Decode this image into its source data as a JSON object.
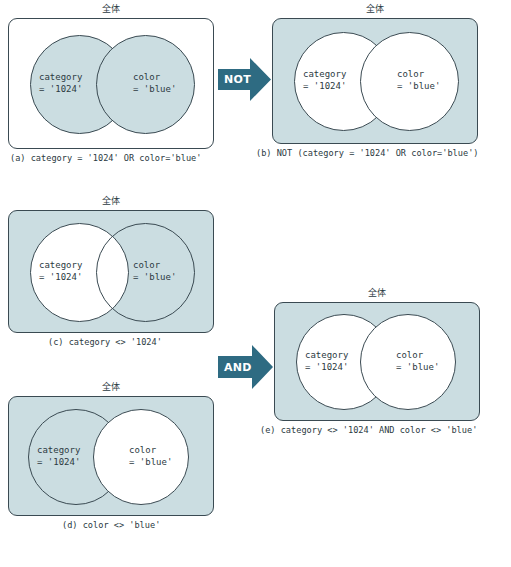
{
  "figure": {
    "universe_label": "全体",
    "circle_left_line1": "category",
    "circle_left_line2": "= '1024'",
    "circle_right_line1": "color",
    "circle_right_line2": "= 'blue'",
    "colors": {
      "shade": "#cbdde1",
      "stroke": "#3a4a52",
      "arrow": "#2e6b82",
      "text": "#2b3a42",
      "white": "#ffffff"
    }
  },
  "panels": [
    {
      "id": "a",
      "caption": "(a) category = '1024' OR color='blue'",
      "universe_label": "全体",
      "universe_shaded": false,
      "left_circle_shaded": true,
      "right_circle_shaded": true,
      "left_line1": "category",
      "left_line2": "= '1024'",
      "right_line1": "color",
      "right_line2": "= 'blue'"
    },
    {
      "id": "b",
      "caption": "(b) NOT (category = '1024' OR color='blue')",
      "universe_label": "全体",
      "universe_shaded": true,
      "left_circle_shaded": false,
      "right_circle_shaded": false,
      "left_line1": "category",
      "left_line2": "= '1024'",
      "right_line1": "color",
      "right_line2": "= 'blue'"
    },
    {
      "id": "c",
      "caption": "(c) category <> '1024'",
      "universe_label": "全体",
      "universe_shaded": true,
      "left_circle_shaded": false,
      "right_circle_shaded": true,
      "left_line1": "category",
      "left_line2": "= '1024'",
      "right_line1": "color",
      "right_line2": "= 'blue'"
    },
    {
      "id": "d",
      "caption": "(d) color <> 'blue'",
      "universe_label": "全体",
      "universe_shaded": true,
      "left_circle_shaded": true,
      "right_circle_shaded": false,
      "left_line1": "category",
      "left_line2": "= '1024'",
      "right_line1": "color",
      "right_line2": "= 'blue'"
    },
    {
      "id": "e",
      "caption": "(e) category <> '1024' AND color <> 'blue'",
      "universe_label": "全体",
      "universe_shaded": true,
      "left_circle_shaded": false,
      "right_circle_shaded": false,
      "left_line1": "category",
      "left_line2": "= '1024'",
      "right_line1": "color",
      "right_line2": "= 'blue'"
    }
  ],
  "arrows": [
    {
      "id": "not",
      "label": "NOT"
    },
    {
      "id": "and",
      "label": "AND"
    }
  ]
}
